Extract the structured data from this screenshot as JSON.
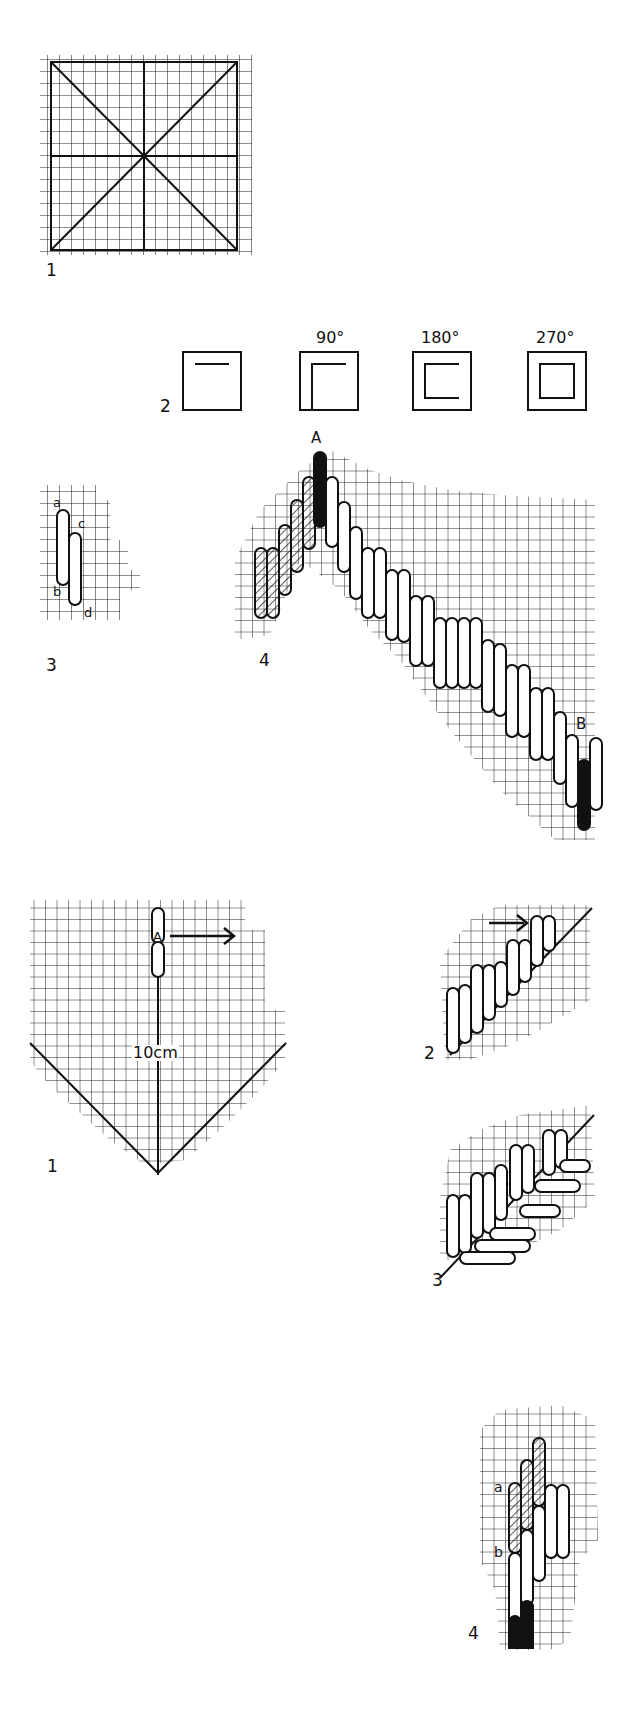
{
  "figures": {
    "square_grid": {
      "label": "1"
    },
    "rotations": {
      "label": "2",
      "angles": [
        "",
        "90°",
        "180°",
        "270°"
      ]
    },
    "stitch_small": {
      "label": "3",
      "points": [
        "a",
        "b",
        "c",
        "d"
      ]
    },
    "stitch_diagonal": {
      "label": "4",
      "start": "A",
      "end": "B"
    },
    "chevron": {
      "label": "1",
      "point": "A",
      "measure": "10cm"
    },
    "slant_row": {
      "label": "2"
    },
    "herringbone": {
      "label": "3"
    },
    "stepped": {
      "label": "4",
      "points": [
        "a",
        "b"
      ]
    }
  },
  "colors": {
    "ink": "#111111",
    "paper": "#ffffff",
    "grid": "#222222"
  }
}
